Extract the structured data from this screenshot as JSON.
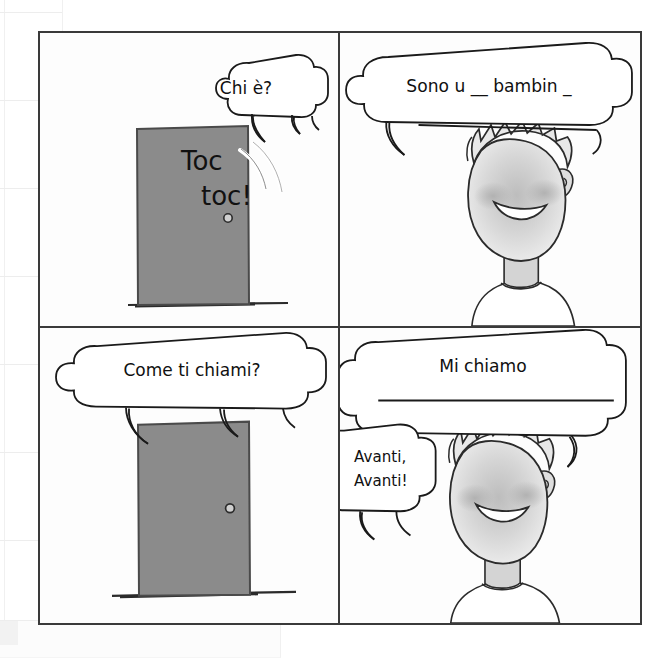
{
  "worksheet": {
    "title": "Toc toc - Chi e? comic worksheet",
    "language": "Italian",
    "background": {
      "grid_color": "#f0f0f0",
      "page_color": "#ffffff"
    },
    "frame": {
      "border_color": "#3a3a3a",
      "fill_color": "#fdfdfd"
    },
    "colors": {
      "door": "#8b8b8b",
      "door_outline": "#4a4a4a",
      "face": "#dcdcdc",
      "face_outline": "#3a3a3a",
      "blush": "#b9b9b9",
      "hair": "#e2e2e2",
      "ink": "#101010"
    }
  },
  "panels": [
    {
      "id": "panel-1",
      "position": "top-left",
      "bubble": {
        "text": "Chi è?",
        "type": "speech-bubble"
      },
      "sound_effect": {
        "line1": "Toc",
        "line2": "toc!"
      },
      "objects": [
        "door",
        "doorknob",
        "knock-lines",
        "ground-line"
      ]
    },
    {
      "id": "panel-2",
      "position": "top-right",
      "bubble": {
        "text": "Sono u __  bambin _",
        "type": "speech-bubble"
      },
      "objects": [
        "boy-face",
        "spiky-hair",
        "smile",
        "blush",
        "ear",
        "neck",
        "shirt"
      ]
    },
    {
      "id": "panel-3",
      "position": "bottom-left",
      "bubble": {
        "text": "Come ti chiami?",
        "type": "speech-bubble"
      },
      "objects": [
        "door",
        "doorknob",
        "ground-line"
      ]
    },
    {
      "id": "panel-4",
      "position": "bottom-right",
      "bubble": {
        "text": "Mi chiamo",
        "type": "speech-bubble",
        "answer_line": true
      },
      "bubble2": {
        "line1": "Avanti,",
        "line2": "Avanti!",
        "type": "speech-bubble"
      },
      "objects": [
        "boy-face",
        "spiky-hair",
        "smile",
        "blush",
        "ear",
        "neck",
        "shirt"
      ]
    }
  ]
}
